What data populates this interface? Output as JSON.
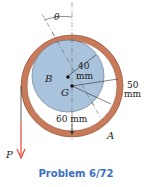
{
  "figure": {
    "labels": {
      "theta": "θ",
      "disk": "B",
      "center": "G",
      "ring": "A",
      "force": "P",
      "dim_40": "40",
      "dim_40_unit": "mm",
      "dim_50": "50",
      "dim_50_unit": "mm",
      "dim_60": "60 mm"
    },
    "colors": {
      "ring": "#c97a5a",
      "ring_edge": "#8a4a32",
      "disk": "#a9c3dc",
      "disk_edge": "#5a6f85",
      "force_arrow": "#e8432e",
      "caption": "#3a6fc4"
    }
  },
  "caption": "Problem 6/72"
}
